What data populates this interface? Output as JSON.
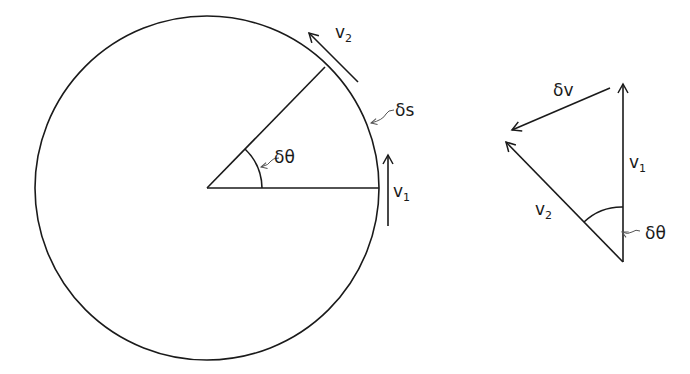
{
  "diagram": {
    "left": {
      "labels": {
        "v2": "v",
        "v2_sub": "2",
        "v1": "v",
        "v1_sub": "1",
        "ds": "δs",
        "dtheta": "δθ"
      }
    },
    "right": {
      "labels": {
        "dv": "δv",
        "v1": "v",
        "v1_sub": "1",
        "v2": "v",
        "v2_sub": "2",
        "dtheta": "δθ"
      }
    }
  }
}
